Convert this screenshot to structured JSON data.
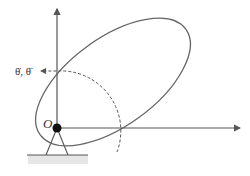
{
  "diagram": {
    "type": "rotating-rigid-body-about-pivot",
    "labels": {
      "origin": "O",
      "angular_quantities": "θ̇, θ̈"
    },
    "colors": {
      "stroke": "#555555",
      "pivot": "#111111",
      "ground_hatch": "#e6e6e6"
    },
    "elements": {
      "vertical_axis": "y-axis arrow",
      "horizontal_axis": "x-axis arrow",
      "body": "tilted ellipse (rigid body)",
      "rotation_arc": "dashed arc with arrow indicating rotation direction",
      "support": "triangular pin support on ground"
    }
  }
}
